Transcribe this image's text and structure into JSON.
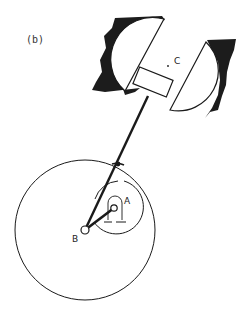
{
  "figure": {
    "panel_label": "(b)",
    "labels": {
      "pivot_a": "A",
      "pivot_b": "B",
      "center_c": "C"
    },
    "colors": {
      "ink": "#1a1a1a",
      "background": "#ffffff",
      "wall": "#1c1c1c"
    }
  }
}
